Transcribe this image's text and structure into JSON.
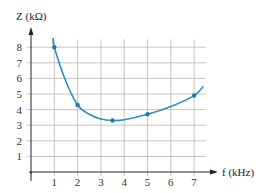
{
  "chart_data": {
    "type": "line",
    "title": "",
    "xlabel": "f (kHz)",
    "ylabel": "Z (kΩ)",
    "x_ticks": [
      1,
      2,
      3,
      4,
      5,
      6,
      7
    ],
    "y_ticks": [
      1,
      2,
      3,
      4,
      5,
      6,
      7,
      8
    ],
    "xlim": [
      0,
      7.5
    ],
    "ylim": [
      0,
      8.8
    ],
    "grid": true,
    "legend": null,
    "series": [
      {
        "name": "Z vs f",
        "color": "#2b8fc0",
        "markers": [
          {
            "x": 1,
            "y": 8.0
          },
          {
            "x": 2,
            "y": 4.3
          },
          {
            "x": 3.5,
            "y": 3.3
          },
          {
            "x": 5,
            "y": 3.7
          },
          {
            "x": 7,
            "y": 4.9
          }
        ],
        "curve": [
          {
            "x": 0.95,
            "y": 8.6
          },
          {
            "x": 1,
            "y": 8.0
          },
          {
            "x": 1.5,
            "y": 5.8
          },
          {
            "x": 2,
            "y": 4.3
          },
          {
            "x": 2.5,
            "y": 3.7
          },
          {
            "x": 3,
            "y": 3.4
          },
          {
            "x": 3.5,
            "y": 3.3
          },
          {
            "x": 4,
            "y": 3.35
          },
          {
            "x": 5,
            "y": 3.7
          },
          {
            "x": 6,
            "y": 4.2
          },
          {
            "x": 7,
            "y": 4.9
          },
          {
            "x": 7.4,
            "y": 5.5
          }
        ]
      }
    ]
  },
  "colors": {
    "grid": "#b8b8b8",
    "axis": "#222222",
    "curve": "#2b8fc0",
    "marker": "#1f7aa8"
  }
}
